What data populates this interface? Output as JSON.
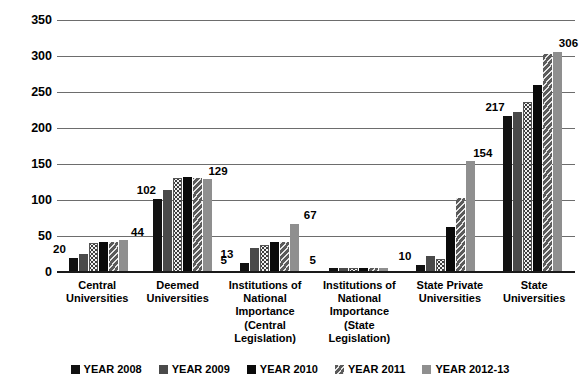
{
  "chart_data": {
    "type": "bar",
    "title": "",
    "xlabel": "",
    "ylabel": "",
    "ylim": [
      0,
      350
    ],
    "yticks": [
      0,
      50,
      100,
      150,
      200,
      250,
      300,
      350
    ],
    "grid": true,
    "legend_position": "bottom",
    "categories": [
      "Central Universities",
      "Deemed Universities",
      "Institutions of National Importance (Central Legislation)",
      "Institutions of National Importance (State Legislation)",
      "State Private Universities",
      "State Universities"
    ],
    "category_lines": [
      [
        "Central",
        "Universities"
      ],
      [
        "Deemed",
        "Universities"
      ],
      [
        "Institutions of",
        "National",
        "Importance",
        "(Central",
        "Legislation)"
      ],
      [
        "Institutions of",
        "National",
        "Importance",
        "(State",
        "Legislation)"
      ],
      [
        "State Private",
        "Universities"
      ],
      [
        "State",
        "Universities"
      ]
    ],
    "legend": [
      "YEAR 2008",
      "YEAR 2009",
      "YEAR 2010",
      "YEAR 2011",
      "YEAR 2012-13"
    ],
    "series": [
      {
        "name": "YEAR 2008",
        "values": [
          20,
          102,
          13,
          5,
          10,
          217
        ]
      },
      {
        "name": "YEAR 2009",
        "values": [
          25,
          114,
          33,
          5,
          22,
          222
        ]
      },
      {
        "name": "YEAR 2010",
        "values": [
          40,
          130,
          38,
          5,
          18,
          236
        ]
      },
      {
        "name": "YEAR 2011",
        "values": [
          41,
          132,
          42,
          5,
          63,
          260
        ]
      },
      {
        "name": "YEAR 2012-13",
        "values": [
          42,
          131,
          42,
          5,
          103,
          303
        ]
      },
      {
        "name": "YEAR 2012-13b",
        "values": [
          44,
          129,
          67,
          5,
          154,
          306
        ]
      }
    ],
    "annotations": [
      {
        "text": "20",
        "category": 0,
        "value": 20
      },
      {
        "text": "44",
        "category": 0,
        "value": 44
      },
      {
        "text": "102",
        "category": 1,
        "value": 102
      },
      {
        "text": "129",
        "category": 1,
        "value": 129
      },
      {
        "text": "13",
        "category": 2,
        "value": 13
      },
      {
        "text": "67",
        "category": 2,
        "value": 67
      },
      {
        "text": "5",
        "category": 2,
        "value": 5
      },
      {
        "text": "5",
        "category": 3,
        "value": 5
      },
      {
        "text": "10",
        "category": 4,
        "value": 10
      },
      {
        "text": "154",
        "category": 4,
        "value": 154
      },
      {
        "text": "217",
        "category": 5,
        "value": 217
      },
      {
        "text": "306",
        "category": 5,
        "value": 306
      }
    ],
    "colors": {
      "series_2008": "#111111",
      "series_2009": "#4a4a4a",
      "series_2010": "#f2f2f2",
      "series_2011": "#0a0a0a",
      "series_2012": "#5a5a5a",
      "series_2013": "#8f8f8f",
      "gridline": "#6d6d6d",
      "axis": "#1a1a1a",
      "text": "#000000",
      "background": "#ffffff"
    }
  }
}
